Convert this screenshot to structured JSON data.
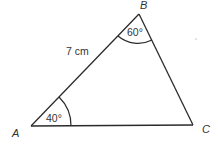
{
  "diagram": {
    "type": "triangle",
    "vertices": {
      "A": {
        "label": "A"
      },
      "B": {
        "label": "B"
      },
      "C": {
        "label": "C"
      }
    },
    "side_AB_label": "7 cm",
    "angle_A_label": "40°",
    "angle_B_label": "60°",
    "colors": {
      "stroke": "#2b2b2b",
      "text": "#333333",
      "background": "#ffffff"
    }
  }
}
